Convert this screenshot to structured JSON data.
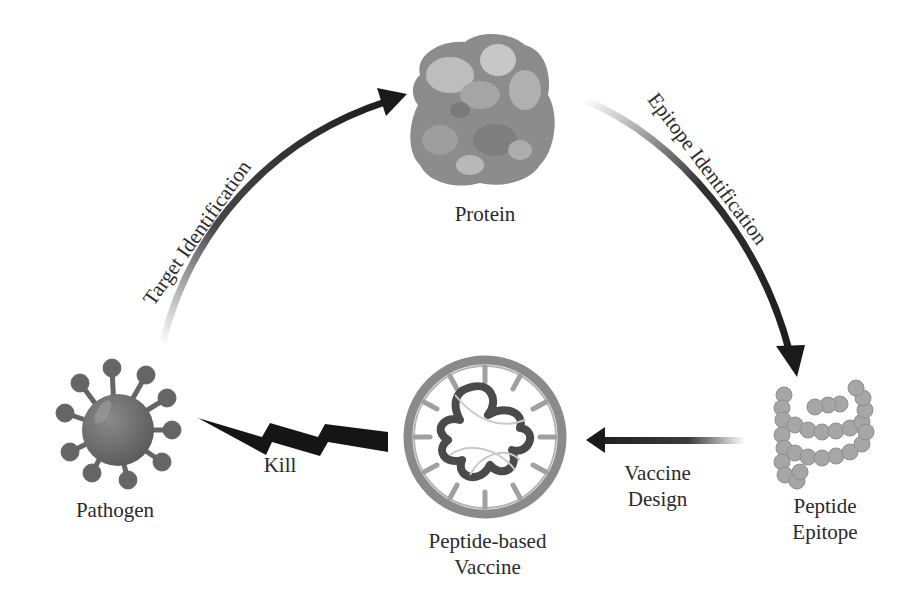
{
  "diagram": {
    "type": "cycle",
    "nodes": [
      {
        "id": "pathogen",
        "label": "Pathogen",
        "icon": "virus-icon"
      },
      {
        "id": "protein",
        "label": "Protein",
        "icon": "protein-icon"
      },
      {
        "id": "peptide_epitope",
        "label_line1": "Peptide",
        "label_line2": "Epitope",
        "icon": "peptide-chain-icon"
      },
      {
        "id": "vaccine",
        "label_line1": "Peptide-based",
        "label_line2": "Vaccine",
        "icon": "vaccine-particle-icon"
      }
    ],
    "edges": [
      {
        "from": "pathogen",
        "to": "protein",
        "label": "Target Identification"
      },
      {
        "from": "protein",
        "to": "peptide_epitope",
        "label": "Epitope Identification"
      },
      {
        "from": "peptide_epitope",
        "to": "vaccine",
        "label_line1": "Vaccine",
        "label_line2": "Design"
      },
      {
        "from": "vaccine",
        "to": "pathogen",
        "label": "Kill",
        "style": "lightning-bolt"
      }
    ],
    "colors": {
      "arrow": "#1a1a1a",
      "text": "#2a2a2a",
      "pathogen_fill": "#6e6e6e",
      "protein_fill": "#9a9a9a",
      "peptide_fill": "#a8a8a8"
    }
  }
}
